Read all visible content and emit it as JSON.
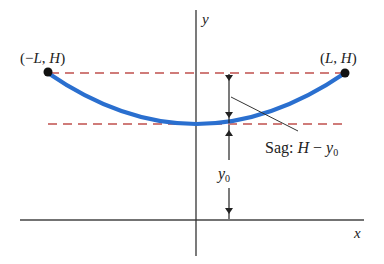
{
  "diagram": {
    "colors": {
      "curve": "#2a6fcf",
      "dashed": "#c0504d",
      "axis": "#333333",
      "text": "#222222",
      "point": "#111111"
    },
    "axes": {
      "x_label": "x",
      "y_label": "y"
    },
    "points": {
      "left": {
        "open": "(",
        "minus": "−",
        "var1": "L",
        "sep": ", ",
        "var2": "H",
        "close": ")"
      },
      "right": {
        "open": "(",
        "var1": "L",
        "sep": ", ",
        "var2": "H",
        "close": ")"
      }
    },
    "labels": {
      "sag_prefix": "Sag: ",
      "sag_H": "H",
      "sag_minus": " − ",
      "sag_y": "y",
      "sag_sub": "0",
      "y0_main": "y",
      "y0_sub": "0"
    }
  }
}
